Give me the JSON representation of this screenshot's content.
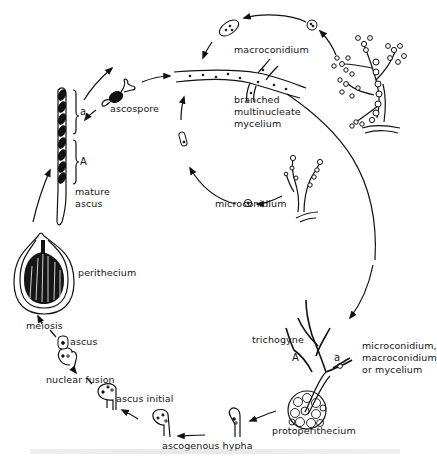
{
  "diagram": {
    "labels": {
      "macroconidium": "macroconidium",
      "mycelium_line1": "branched",
      "mycelium_line2": "multinucleate",
      "mycelium_line3": "mycelium",
      "microconidium": "microconidium",
      "ascospore": "ascospore",
      "mating_a": "a",
      "mating_A": "A",
      "mature_ascus_line1": "mature",
      "mature_ascus_line2": "ascus",
      "perithecium": "perithecium",
      "meiosis": "meiosis",
      "ascus": "ascus",
      "nuclear_fusion": "nuclear fusion",
      "ascus_initial": "ascus initial",
      "ascogenous_hypha": "ascogenous hypha",
      "protoperithecium": "protoperithecium",
      "trichogyne": "trichogyne",
      "trichogyne_A": "A",
      "trichogyne_a": "a",
      "fertilizer_line1": "microconidium,",
      "fertilizer_line2": "macroconidium",
      "fertilizer_line3": "or mycelium"
    },
    "nodes": [
      {
        "id": "mycelium",
        "label": "branched multinucleate mycelium"
      },
      {
        "id": "macroconidiophore",
        "label": "macroconidium"
      },
      {
        "id": "microconidiophore",
        "label": "microconidium"
      },
      {
        "id": "protoperithecium",
        "label": "protoperithecium"
      },
      {
        "id": "ascogenous-hypha",
        "label": "ascogenous hypha"
      },
      {
        "id": "ascus-initial",
        "label": "ascus initial"
      },
      {
        "id": "nuclear-fusion",
        "label": "nuclear fusion"
      },
      {
        "id": "ascus",
        "label": "ascus"
      },
      {
        "id": "perithecium",
        "label": "perithecium"
      },
      {
        "id": "mature-ascus",
        "label": "mature ascus"
      },
      {
        "id": "ascospore",
        "label": "ascospore"
      }
    ],
    "edges": [
      {
        "from": "mycelium",
        "to": "macroconidiophore"
      },
      {
        "from": "macroconidiophore",
        "to": "mycelium",
        "via": "macroconidium"
      },
      {
        "from": "mycelium",
        "to": "microconidiophore"
      },
      {
        "from": "microconidiophore",
        "to": "mycelium",
        "via": "microconidium"
      },
      {
        "from": "mycelium",
        "to": "protoperithecium",
        "via": "microconidium, macroconidium or mycelium"
      },
      {
        "from": "protoperithecium",
        "to": "ascogenous-hypha"
      },
      {
        "from": "ascogenous-hypha",
        "to": "ascus-initial"
      },
      {
        "from": "ascus-initial",
        "to": "nuclear-fusion"
      },
      {
        "from": "nuclear-fusion",
        "to": "ascus"
      },
      {
        "from": "ascus",
        "to": "perithecium",
        "via": "meiosis"
      },
      {
        "from": "perithecium",
        "to": "mature-ascus"
      },
      {
        "from": "mature-ascus",
        "to": "ascospore"
      },
      {
        "from": "ascospore",
        "to": "mycelium"
      }
    ],
    "colors": {
      "ink": "#111111",
      "background": "#ffffff"
    }
  }
}
